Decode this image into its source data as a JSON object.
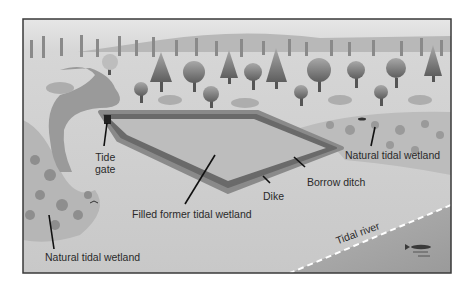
{
  "diagram": {
    "type": "illustrated landscape cross-section",
    "colors": {
      "frame": "#3a3a3a",
      "sky": "#d8d8d8",
      "land": "#cfcfcf",
      "channel_water": "#9a9a9a",
      "pond_fill": "#bdbdbd",
      "dike": "#6a6a6a",
      "borrow_ditch": "#8a8a8a",
      "river": "#a4a4a4",
      "river_edge_dash": "#ffffff",
      "trees": "#7c7c7c",
      "leader_lines": "#111111"
    },
    "labels": {
      "tide_gate_line1": "Tide",
      "tide_gate_line2": "gate",
      "filled_wetland": "Filled former tidal wetland",
      "dike": "Dike",
      "borrow_ditch": "Borrow ditch",
      "natural_wetland_right": "Natural tidal wetland",
      "natural_wetland_left": "Natural tidal wetland",
      "tidal_river": "Tidal river"
    },
    "icons": [
      "tree-icon",
      "fish-icon",
      "bird-icon",
      "tide-gate-icon"
    ]
  }
}
